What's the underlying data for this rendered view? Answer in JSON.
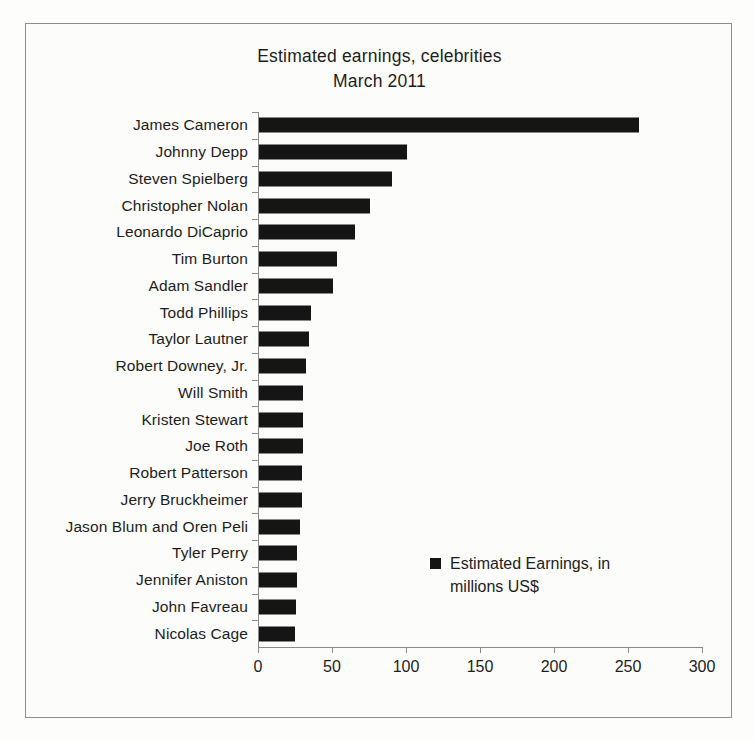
{
  "chart_data": {
    "type": "bar",
    "orientation": "horizontal",
    "title": "Estimated earnings, celebrities",
    "subtitle": "March 2011",
    "xlabel": "",
    "ylabel": "",
    "xlim": [
      0,
      300
    ],
    "xticks": [
      0,
      50,
      100,
      150,
      200,
      250,
      300
    ],
    "xtick_labels": [
      "0",
      "50",
      "100",
      "150",
      "200",
      "250",
      "300"
    ],
    "grid": false,
    "legend_position": "center-right",
    "legend": [
      {
        "label": "Estimated Earnings, in millions US$",
        "label_line1": "Estimated Earnings, in",
        "label_line2": "millions US$",
        "color": "#151515"
      }
    ],
    "series_name": "Estimated Earnings, in millions US$",
    "bar_color": "#151515",
    "categories": [
      "James Cameron",
      "Johnny Depp",
      "Steven Spielberg",
      "Christopher Nolan",
      "Leonardo DiCaprio",
      "Tim Burton",
      "Adam Sandler",
      "Todd Phillips",
      "Taylor Lautner",
      "Robert Downey, Jr.",
      "Will Smith",
      "Kristen Stewart",
      "Joe Roth",
      "Robert Patterson",
      "Jerry Bruckheimer",
      "Jason Blum and Oren Peli",
      "Tyler Perry",
      "Jennifer Aniston",
      "John Favreau",
      "Nicolas Cage"
    ],
    "values": [
      257,
      100,
      90,
      75,
      65,
      53,
      50,
      35,
      34,
      32,
      30,
      30,
      30,
      29,
      29,
      28,
      26,
      26,
      25,
      24
    ]
  },
  "figure": {
    "background_color": "#fcfcfa",
    "frame_color": "#8e8e8e",
    "axis_color": "#8a8a8a",
    "text_color": "#1d1d1d"
  }
}
